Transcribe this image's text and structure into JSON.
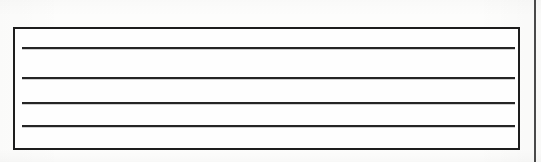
{
  "document": {
    "kind": "scanned-form-fragment",
    "background_color": "#fdfdfc",
    "width": 541,
    "height": 162
  },
  "form_box": {
    "name": "ruled-entry-box",
    "x": 13,
    "y": 27,
    "width": 507,
    "height": 123,
    "border_color": "#1d1d1d",
    "border_width": 2,
    "fill_color": "#fefefe"
  },
  "rules": {
    "color": "#252525",
    "thickness": 2,
    "x": 22,
    "width": 493,
    "items": [
      {
        "name": "writing-line-1",
        "y": 47
      },
      {
        "name": "writing-line-2",
        "y": 77
      },
      {
        "name": "writing-line-3",
        "y": 102
      },
      {
        "name": "writing-line-4",
        "y": 125
      }
    ]
  },
  "right_divider": {
    "name": "page-column-divider",
    "x": 534,
    "y": 0,
    "height": 162,
    "color": "#4a4a4a",
    "thickness": 2
  }
}
